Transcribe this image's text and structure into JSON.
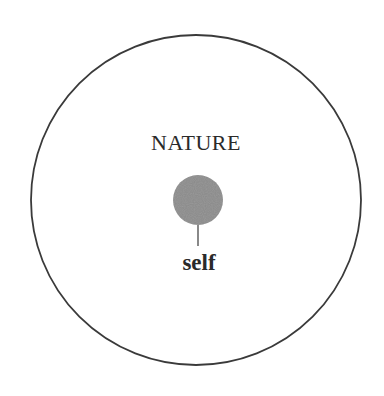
{
  "diagram": {
    "outer_label": "NATURE",
    "inner_label": "self",
    "colors": {
      "outer_stroke": "#3a3a3a",
      "inner_fill": "#8c8c8c",
      "text": "#2a2a2a",
      "background": "#ffffff"
    },
    "shapes": {
      "outer_circle": {
        "cx": 196,
        "cy": 200,
        "r": 165
      },
      "inner_circle": {
        "cx": 198,
        "cy": 200,
        "r": 25
      },
      "stem": {
        "x": 198,
        "y1": 225,
        "y2": 246
      }
    }
  }
}
